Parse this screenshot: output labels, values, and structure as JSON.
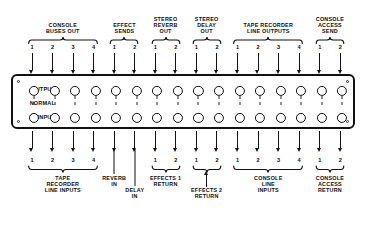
{
  "diagram": {
    "panel": {
      "row_labels": {
        "output": "OUTPUT",
        "normal": "NORMAL",
        "input": "INPUT"
      },
      "jack_columns": 16,
      "jack_rows": 2
    },
    "top": {
      "groups": [
        {
          "label": "CONSOLE\nBUSES OUT",
          "numbers": [
            "1",
            "2",
            "3",
            "4"
          ]
        },
        {
          "label": "EFFECT\nSENDS",
          "numbers": [
            "1",
            "2"
          ]
        },
        {
          "label": "STEREO\nREVERB\nOUT",
          "numbers": [
            "1",
            "2"
          ]
        },
        {
          "label": "STEREO\nDELAY\nOUT",
          "numbers": [
            "1",
            "2"
          ]
        },
        {
          "label": "TAPE RECORDER\nLINE OUTPUTS",
          "numbers": [
            "1",
            "2",
            "3",
            "4"
          ]
        },
        {
          "label": "CONSOLE\nACCESS\nSEND",
          "numbers": [
            "1",
            "2"
          ]
        }
      ]
    },
    "bottom": {
      "groups": [
        {
          "label": "TAPE\nRECORDER\nLINE INPUTS",
          "numbers": [
            "1",
            "2",
            "3",
            "4"
          ]
        },
        {
          "label": "REVERB\nIN",
          "numbers": []
        },
        {
          "label": "DELAY\nIN",
          "numbers": []
        },
        {
          "label": "EFFECTS 1\nRETURN",
          "numbers": [
            "1",
            "2"
          ]
        },
        {
          "label": "EFFECTS 2\nRETURN",
          "numbers": [
            "1",
            "2"
          ]
        },
        {
          "label": "CONSOLE\nLINE\nINPUTS",
          "numbers": [
            "1",
            "2",
            "3",
            "4"
          ]
        },
        {
          "label": "CONSOLE\nACCESS\nRETURN",
          "numbers": [
            "1",
            "2"
          ]
        }
      ]
    },
    "colors": {
      "ink": "#111111",
      "paper": "#ffffff"
    }
  }
}
